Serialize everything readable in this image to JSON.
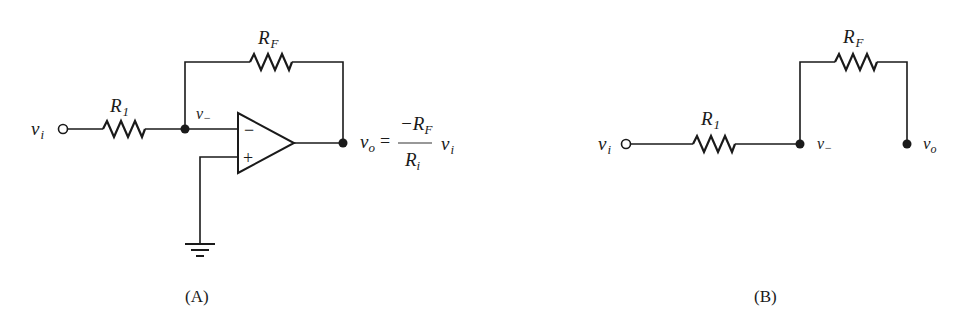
{
  "figure": {
    "panel_a": {
      "caption": "(A)",
      "input_label": "v",
      "input_sub": "i",
      "r1_label": "R",
      "r1_sub": "1",
      "rf_label": "R",
      "rf_sub": "F",
      "node_label": "v",
      "node_sub": "−",
      "opamp_minus": "−",
      "opamp_plus": "+",
      "equation": {
        "lhs": "v",
        "lhs_sub": "o",
        "equals": "=",
        "numerator": "−R",
        "numerator_sub": "F",
        "denominator": "R",
        "denominator_sub": "i",
        "factor": "v",
        "factor_sub": "i"
      }
    },
    "panel_b": {
      "caption": "(B)",
      "input_label": "v",
      "input_sub": "i",
      "r1_label": "R",
      "r1_sub": "1",
      "rf_label": "R",
      "rf_sub": "F",
      "node_label": "v",
      "node_sub": "−",
      "output_label": "v",
      "output_sub": "o"
    }
  }
}
